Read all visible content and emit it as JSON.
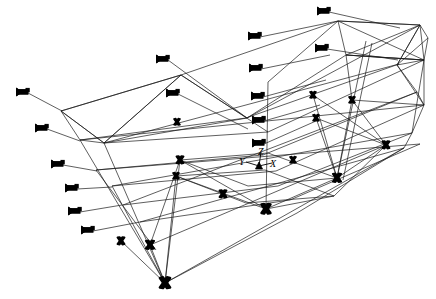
{
  "figure": {
    "kind": "3d-wireframe-structural-model",
    "background_color": "#ffffff",
    "line_color": "#1a1a1a",
    "marker_color": "#000000",
    "line_width": 0.7,
    "width": 436,
    "height": 299
  },
  "axis_triad": {
    "origin": {
      "x": 259,
      "y": 166
    },
    "labels": [
      {
        "name": "y-axis-label",
        "text": "Y",
        "x": 239,
        "y": 157
      },
      {
        "name": "z-axis-label",
        "text": "Z",
        "x": 258,
        "y": 147
      },
      {
        "name": "x-axis-label",
        "text": "X",
        "x": 270,
        "y": 159
      }
    ],
    "arms": [
      {
        "name": "y-axis-arm",
        "x1": 259,
        "y1": 166,
        "x2": 246,
        "y2": 162
      },
      {
        "name": "z-axis-arm",
        "x1": 259,
        "y1": 166,
        "x2": 261,
        "y2": 152
      },
      {
        "name": "x-axis-arm",
        "x1": 259,
        "y1": 166,
        "x2": 272,
        "y2": 163
      }
    ]
  },
  "geometry": {
    "polylines": [
      {
        "name": "top-deck-outer-edge",
        "points": "61,111 181,75 338,21 420,25"
      },
      {
        "name": "top-deck-near-edge",
        "points": "61,111 104,143 247,118 420,25"
      },
      {
        "name": "top-deck-far-edge",
        "points": "181,75 247,118"
      },
      {
        "name": "top-deck-right-end",
        "points": "420,25 428,38 424,60 397,65"
      },
      {
        "name": "top-deck-right-inner",
        "points": "420,25 397,65"
      },
      {
        "name": "upper-chord-left",
        "points": "61,111 80,140 104,143"
      },
      {
        "name": "mid-chord-long-a",
        "points": "80,140 246,118 399,64"
      },
      {
        "name": "mid-chord-long-b",
        "points": "104,143 268,132 424,60"
      },
      {
        "name": "lower-chord-long-a",
        "points": "96,170 263,155 417,92"
      },
      {
        "name": "lower-chord-long-b",
        "points": "112,186 276,171 424,105"
      },
      {
        "name": "bottom-chord-long-a",
        "points": "123,205 278,186 412,133"
      },
      {
        "name": "bottom-chord-long-b",
        "points": "140,222 290,200 420,144"
      },
      {
        "name": "base-chord-long",
        "points": "165,283 297,213 404,148"
      },
      {
        "name": "deck-plate-upper",
        "points": "180,160 268,153 337,178 248,186 180,160"
      },
      {
        "name": "deck-plate-lower",
        "points": "176,176 265,170 334,196 246,203 176,176"
      },
      {
        "name": "right-tower-outer",
        "points": "397,65 417,92 424,105 412,133 404,148"
      },
      {
        "name": "right-panel-top",
        "points": "338,21 420,25 424,60 346,55 338,21"
      },
      {
        "name": "right-panel-mid",
        "points": "346,55 424,60 424,105 352,100 346,55"
      },
      {
        "name": "left-fan-a",
        "points": "181,75 104,143"
      },
      {
        "name": "left-fan-b",
        "points": "181,75 61,111"
      }
    ],
    "segments": [
      {
        "name": "vertical-post-center",
        "x1": 268,
        "y1": 82,
        "x2": 266,
        "y2": 209
      },
      {
        "name": "vertical-post-right",
        "x1": 366,
        "y1": 41,
        "x2": 337,
        "y2": 178
      },
      {
        "name": "vertical-post-right2",
        "x1": 372,
        "y1": 43,
        "x2": 343,
        "y2": 180
      },
      {
        "name": "left-leg-a",
        "x1": 104,
        "y1": 143,
        "x2": 165,
        "y2": 283
      },
      {
        "name": "left-leg-b",
        "x1": 80,
        "y1": 140,
        "x2": 165,
        "y2": 283
      },
      {
        "name": "left-leg-c",
        "x1": 120,
        "y1": 240,
        "x2": 165,
        "y2": 283
      },
      {
        "name": "left-leg-d",
        "x1": 96,
        "y1": 170,
        "x2": 156,
        "y2": 250
      },
      {
        "name": "left-leg-e",
        "x1": 112,
        "y1": 186,
        "x2": 165,
        "y2": 283
      },
      {
        "name": "brace-1",
        "x1": 165,
        "y1": 283,
        "x2": 150,
        "y2": 245
      },
      {
        "name": "brace-2",
        "x1": 165,
        "y1": 283,
        "x2": 180,
        "y2": 160
      },
      {
        "name": "brace-3",
        "x1": 180,
        "y1": 160,
        "x2": 150,
        "y2": 245
      },
      {
        "name": "brace-4",
        "x1": 176,
        "y1": 176,
        "x2": 165,
        "y2": 283
      },
      {
        "name": "brace-5",
        "x1": 266,
        "y1": 209,
        "x2": 180,
        "y2": 160
      },
      {
        "name": "brace-6",
        "x1": 266,
        "y1": 209,
        "x2": 176,
        "y2": 176
      },
      {
        "name": "brace-7",
        "x1": 266,
        "y1": 209,
        "x2": 337,
        "y2": 178
      },
      {
        "name": "brace-8",
        "x1": 266,
        "y1": 209,
        "x2": 334,
        "y2": 196
      },
      {
        "name": "brace-9",
        "x1": 337,
        "y1": 178,
        "x2": 313,
        "y2": 95
      },
      {
        "name": "brace-10",
        "x1": 337,
        "y1": 178,
        "x2": 316,
        "y2": 118
      },
      {
        "name": "brace-11",
        "x1": 337,
        "y1": 178,
        "x2": 352,
        "y2": 100
      },
      {
        "name": "brace-12",
        "x1": 337,
        "y1": 178,
        "x2": 386,
        "y2": 145
      },
      {
        "name": "brace-13",
        "x1": 334,
        "y1": 196,
        "x2": 386,
        "y2": 145
      },
      {
        "name": "brace-14",
        "x1": 313,
        "y1": 95,
        "x2": 386,
        "y2": 145
      },
      {
        "name": "brace-15",
        "x1": 316,
        "y1": 118,
        "x2": 386,
        "y2": 145
      },
      {
        "name": "brace-16",
        "x1": 352,
        "y1": 100,
        "x2": 386,
        "y2": 145
      },
      {
        "name": "brace-17",
        "x1": 397,
        "y1": 65,
        "x2": 424,
        "y2": 105
      },
      {
        "name": "brace-18",
        "x1": 424,
        "y1": 60,
        "x2": 412,
        "y2": 133
      },
      {
        "name": "brace-19",
        "x1": 420,
        "y1": 25,
        "x2": 397,
        "y2": 65
      },
      {
        "name": "brace-20",
        "x1": 428,
        "y1": 38,
        "x2": 397,
        "y2": 65
      },
      {
        "name": "brace-21",
        "x1": 346,
        "y1": 55,
        "x2": 424,
        "y2": 60
      },
      {
        "name": "brace-22",
        "x1": 338,
        "y1": 21,
        "x2": 424,
        "y2": 60
      },
      {
        "name": "brace-23",
        "x1": 420,
        "y1": 25,
        "x2": 346,
        "y2": 55
      },
      {
        "name": "brace-24",
        "x1": 268,
        "y1": 82,
        "x2": 338,
        "y2": 21
      },
      {
        "name": "brace-25",
        "x1": 247,
        "y1": 118,
        "x2": 346,
        "y2": 55
      },
      {
        "name": "brace-26",
        "x1": 181,
        "y1": 75,
        "x2": 268,
        "y2": 132
      },
      {
        "name": "brace-27",
        "x1": 104,
        "y1": 143,
        "x2": 181,
        "y2": 75
      },
      {
        "name": "brace-28",
        "x1": 61,
        "y1": 111,
        "x2": 104,
        "y2": 143
      },
      {
        "name": "diag-long-1",
        "x1": 80,
        "y1": 140,
        "x2": 424,
        "y2": 105
      },
      {
        "name": "diag-long-2",
        "x1": 96,
        "y1": 170,
        "x2": 420,
        "y2": 144
      },
      {
        "name": "diag-long-3",
        "x1": 112,
        "y1": 186,
        "x2": 412,
        "y2": 133
      },
      {
        "name": "diag-long-4",
        "x1": 123,
        "y1": 205,
        "x2": 417,
        "y2": 92
      },
      {
        "name": "diag-long-5",
        "x1": 140,
        "y1": 222,
        "x2": 404,
        "y2": 148
      },
      {
        "name": "diag-long-6",
        "x1": 165,
        "y1": 283,
        "x2": 404,
        "y2": 148
      },
      {
        "name": "diag-long-7",
        "x1": 104,
        "y1": 143,
        "x2": 399,
        "y2": 64
      },
      {
        "name": "diag-long-8",
        "x1": 150,
        "y1": 245,
        "x2": 386,
        "y2": 145
      }
    ],
    "nodes": [
      {
        "name": "node-apex-bottom",
        "x": 165,
        "y": 283,
        "size": 10
      },
      {
        "name": "node-left-low",
        "x": 121,
        "y": 241,
        "size": 7
      },
      {
        "name": "node-left-mid",
        "x": 150,
        "y": 245,
        "size": 8
      },
      {
        "name": "node-center-bottom",
        "x": 266,
        "y": 209,
        "size": 9
      },
      {
        "name": "node-center-mid",
        "x": 223,
        "y": 194,
        "size": 7
      },
      {
        "name": "node-deck-left-a",
        "x": 180,
        "y": 160,
        "size": 7
      },
      {
        "name": "node-deck-left-b",
        "x": 176,
        "y": 176,
        "size": 6
      },
      {
        "name": "node-deck-mid",
        "x": 293,
        "y": 160,
        "size": 6
      },
      {
        "name": "node-right-low",
        "x": 337,
        "y": 178,
        "size": 8
      },
      {
        "name": "node-right-far",
        "x": 386,
        "y": 145,
        "size": 7
      },
      {
        "name": "node-right-upper-a",
        "x": 313,
        "y": 95,
        "size": 6
      },
      {
        "name": "node-right-upper-b",
        "x": 316,
        "y": 118,
        "size": 6
      },
      {
        "name": "node-right-upper-c",
        "x": 352,
        "y": 100,
        "size": 6
      },
      {
        "name": "node-chord-left",
        "x": 177,
        "y": 122,
        "size": 6
      }
    ],
    "load_markers": [
      {
        "name": "load-marker-1",
        "x": 23,
        "y": 92,
        "leader_x": 62,
        "leader_y": 111
      },
      {
        "name": "load-marker-2",
        "x": 42,
        "y": 128,
        "leader_x": 80,
        "leader_y": 141
      },
      {
        "name": "load-marker-3",
        "x": 58,
        "y": 164,
        "leader_x": 97,
        "leader_y": 171
      },
      {
        "name": "load-marker-4",
        "x": 72,
        "y": 188,
        "leader_x": 112,
        "leader_y": 187
      },
      {
        "name": "load-marker-5",
        "x": 75,
        "y": 211,
        "leader_x": 122,
        "leader_y": 205
      },
      {
        "name": "load-marker-6",
        "x": 88,
        "y": 230,
        "leader_x": 140,
        "leader_y": 222
      },
      {
        "name": "load-marker-7",
        "x": 163,
        "y": 59,
        "leader_x": 247,
        "leader_y": 118
      },
      {
        "name": "load-marker-8",
        "x": 173,
        "y": 93,
        "leader_x": 248,
        "leader_y": 129
      },
      {
        "name": "load-marker-9",
        "x": 255,
        "y": 36,
        "leader_x": 338,
        "leader_y": 21
      },
      {
        "name": "load-marker-10",
        "x": 256,
        "y": 68,
        "leader_x": 330,
        "leader_y": 55
      },
      {
        "name": "load-marker-11",
        "x": 258,
        "y": 96,
        "leader_x": 326,
        "leader_y": 80
      },
      {
        "name": "load-marker-12",
        "x": 259,
        "y": 120,
        "leader_x": 320,
        "leader_y": 105
      },
      {
        "name": "load-marker-13",
        "x": 259,
        "y": 143,
        "leader_x": 316,
        "leader_y": 121
      },
      {
        "name": "load-marker-14",
        "x": 324,
        "y": 11,
        "leader_x": 400,
        "leader_y": 28
      },
      {
        "name": "load-marker-15",
        "x": 322,
        "y": 48,
        "leader_x": 398,
        "leader_y": 60
      }
    ]
  }
}
